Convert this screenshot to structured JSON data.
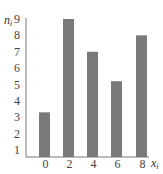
{
  "chart_data": {
    "type": "bar",
    "title": "",
    "xlabel": "x_i",
    "ylabel": "n_i",
    "categories": [
      "0",
      "2",
      "4",
      "6",
      "8"
    ],
    "values": [
      3.3,
      9,
      7,
      5.2,
      8
    ],
    "yticks": [
      1,
      2,
      3,
      4,
      5,
      6,
      7,
      8,
      9
    ],
    "ylim": [
      0.6,
      9
    ],
    "grid": false,
    "legend": null,
    "bar_color": "#7a7a7a",
    "axis_color": "#777777"
  },
  "labels": {
    "y_main": "n",
    "y_sub": "i",
    "x_main": "x",
    "x_sub": "i"
  }
}
